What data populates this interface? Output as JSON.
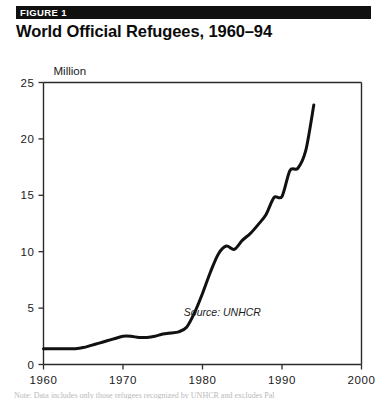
{
  "header": {
    "badge": "FIGURE 1",
    "title": "World Official Refugees, 1960–94"
  },
  "caption": {
    "text": "Note: Data includes only those refugees recognized by UNHCR and excludes Pal"
  },
  "colors": {
    "banner_background": "#101010",
    "banner_text": "#ffffff",
    "title": "#0b0b0b",
    "axis": "#2b2b2b",
    "series": "#111111",
    "page_background": "#ffffff"
  },
  "chart_data": {
    "type": "line",
    "title": "World Official Refugees, 1960–94",
    "subtitle": "",
    "xlabel": "",
    "ylabel": "Million",
    "ylabel_position": "top-left",
    "xlim": [
      1960,
      2000
    ],
    "ylim": [
      0,
      25
    ],
    "xticks": [
      1960,
      1970,
      1980,
      1990,
      2000
    ],
    "xtick_labels": [
      "1960",
      "1970",
      "1980",
      "1990",
      "2000"
    ],
    "yticks": [
      0,
      5,
      10,
      15,
      20,
      25
    ],
    "ytick_labels": [
      "0",
      "5",
      "10",
      "15",
      "20",
      "25"
    ],
    "grid": false,
    "legend": false,
    "annotations": [
      {
        "text": "Source: UNHCR",
        "x": 1982.5,
        "y": 4.3,
        "style": "italic"
      }
    ],
    "series": [
      {
        "name": "World official refugees",
        "units": "million",
        "x": [
          1960,
          1961,
          1962,
          1963,
          1964,
          1965,
          1966,
          1967,
          1968,
          1969,
          1970,
          1971,
          1972,
          1973,
          1974,
          1975,
          1976,
          1977,
          1978,
          1979,
          1980,
          1981,
          1982,
          1983,
          1984,
          1985,
          1986,
          1987,
          1988,
          1989,
          1990,
          1991,
          1992,
          1993,
          1994
        ],
        "y": [
          1.4,
          1.4,
          1.4,
          1.4,
          1.4,
          1.5,
          1.7,
          1.9,
          2.1,
          2.3,
          2.5,
          2.5,
          2.4,
          2.4,
          2.5,
          2.7,
          2.8,
          2.9,
          3.3,
          4.6,
          6.3,
          8.2,
          9.8,
          10.5,
          10.2,
          11.0,
          11.6,
          12.4,
          13.3,
          14.8,
          14.9,
          17.2,
          17.4,
          19.0,
          23.0
        ]
      }
    ]
  }
}
